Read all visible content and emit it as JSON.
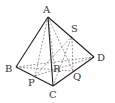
{
  "diagram": {
    "type": "tetrahedron",
    "vertices": {
      "A": {
        "label": "A",
        "x": 48,
        "y": 17,
        "lx": 43,
        "ly": 13
      },
      "B": {
        "label": "B",
        "x": 16,
        "y": 67,
        "lx": 5,
        "ly": 72
      },
      "C": {
        "label": "C",
        "x": 53,
        "y": 86,
        "lx": 49,
        "ly": 98
      },
      "D": {
        "label": "D",
        "x": 94,
        "y": 57,
        "lx": 97,
        "ly": 61
      }
    },
    "points": {
      "S": {
        "label": "S",
        "x": 72,
        "y": 36,
        "lx": 71,
        "ly": 32
      },
      "Q": {
        "label": "Q",
        "x": 73,
        "y": 71,
        "lx": 73,
        "ly": 80
      },
      "P": {
        "label": "P",
        "x": 35,
        "y": 76,
        "lx": 28,
        "ly": 86
      },
      "R": {
        "label": "R",
        "x": 54,
        "y": 64,
        "lx": 53,
        "ly": 72
      }
    },
    "solid_edges": [
      [
        "A",
        "B"
      ],
      [
        "A",
        "C"
      ],
      [
        "A",
        "D"
      ],
      [
        "B",
        "C"
      ],
      [
        "C",
        "D"
      ]
    ],
    "dashed_edges": [
      [
        "B",
        "D"
      ],
      [
        "A",
        "P"
      ],
      [
        "A",
        "Q"
      ],
      [
        "A",
        "R"
      ],
      [
        "P",
        "S"
      ],
      [
        "Q",
        "S"
      ],
      [
        "B",
        "Q"
      ],
      [
        "P",
        "D"
      ],
      [
        "C",
        "S"
      ]
    ]
  }
}
